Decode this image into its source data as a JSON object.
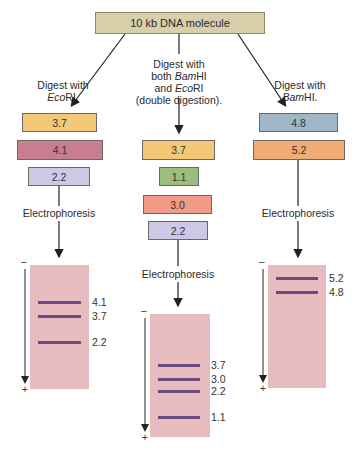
{
  "title": "10 kb DNA molecule",
  "columns": [
    {
      "id": "ecori",
      "digest_label_line1": "Digest with",
      "digest_label_enzyme_italic": "Eco",
      "digest_label_enzyme_rest": "RI.",
      "fragments": [
        {
          "size": "3.7",
          "color": "#f3c978"
        },
        {
          "size": "4.1",
          "color": "#c97d90"
        },
        {
          "size": "2.2",
          "color": "#cdc8e6"
        }
      ],
      "step": "Electrophoresis",
      "gel_bands": [
        "4.1",
        "3.7",
        "2.2"
      ]
    },
    {
      "id": "double",
      "digest_label_line1": "Digest with",
      "digest_label_line2_prefix": "both ",
      "digest_label_line2_italic": "Bam",
      "digest_label_line2_rest": "HI",
      "digest_label_line3_prefix": "and ",
      "digest_label_line3_italic": "Eco",
      "digest_label_line3_rest": "RI",
      "digest_label_line4": "(double digestion).",
      "fragments": [
        {
          "size": "3.7",
          "color": "#f3c978"
        },
        {
          "size": "1.1",
          "color": "#9cbd7e"
        },
        {
          "size": "3.0",
          "color": "#f19a88"
        },
        {
          "size": "2.2",
          "color": "#cdc8e6"
        }
      ],
      "step": "Electrophoresis",
      "gel_bands": [
        "3.7",
        "3.0",
        "2.2",
        "1.1"
      ]
    },
    {
      "id": "bamhi",
      "digest_label_line1": "Digest with",
      "digest_label_enzyme_italic": "Bam",
      "digest_label_enzyme_rest": "HI.",
      "fragments": [
        {
          "size": "4.8",
          "color": "#9fb7c7"
        },
        {
          "size": "5.2",
          "color": "#f1ab74"
        }
      ],
      "step": "Electrophoresis",
      "gel_bands": [
        "5.2",
        "4.8"
      ]
    }
  ],
  "poles": {
    "negative": "–",
    "positive": "+"
  },
  "colors": {
    "gel": "#e8bcbf",
    "band": "#6b4a82",
    "top_box": "#d8ceaa"
  }
}
